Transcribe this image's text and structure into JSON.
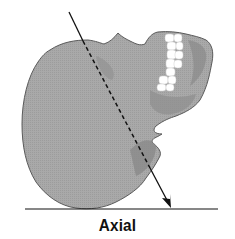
{
  "diagram": {
    "caption": "Axial",
    "projection": "axial",
    "colors": {
      "skull_fill": "#a8a8a8",
      "skull_shadow": "#8e8e8e",
      "skull_outline": "#555555",
      "teeth": "#ffffff",
      "line": "#111111",
      "background": "#ffffff"
    },
    "arrow": {
      "start": [
        69,
        12
      ],
      "skull_entry": [
        83,
        41
      ],
      "skull_exit": [
        150,
        168
      ],
      "end": [
        171,
        208
      ],
      "inside_style": "dashed"
    },
    "baseline": {
      "y": 209,
      "x1": 25,
      "x2": 218
    }
  }
}
